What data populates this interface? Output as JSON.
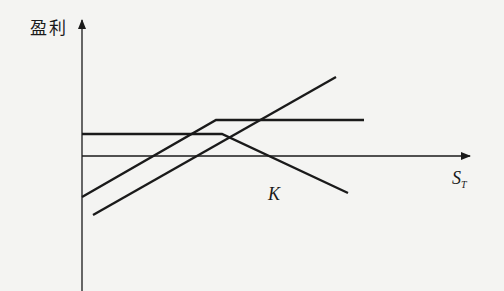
{
  "chart_data": {
    "type": "line",
    "title": "",
    "ylabel": "盈利",
    "xlabel": "S_T",
    "xlabel_main": "S",
    "xlabel_sub": "T",
    "annotations": [
      {
        "text": "K",
        "note": "strike price marker below kink region"
      }
    ],
    "axes": {
      "x_axis_y": 156,
      "y_axis_x": 82
    },
    "series": [
      {
        "name": "rising-then-flat",
        "points": [
          [
            82,
            197
          ],
          [
            216,
            120
          ],
          [
            364,
            120
          ]
        ],
        "description": "payoff rises then flattens (covered call style)"
      },
      {
        "name": "flat-then-falling",
        "points": [
          [
            82,
            134
          ],
          [
            222,
            134
          ],
          [
            348,
            193
          ]
        ],
        "description": "flat premium then declines (short put / short call style)"
      },
      {
        "name": "rising-diagonal",
        "points": [
          [
            93,
            215
          ],
          [
            336,
            77
          ]
        ],
        "description": "linear rising payoff (long stock)"
      }
    ],
    "grid": false,
    "legend": null
  },
  "labels": {
    "y_axis": "盈利",
    "strike": "K",
    "x_main": "S",
    "x_sub": "T"
  },
  "colors": {
    "ink": "#1a1a1a",
    "background": "#f4f4f2"
  }
}
